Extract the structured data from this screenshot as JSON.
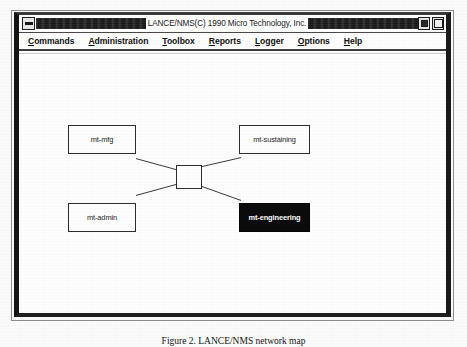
{
  "window": {
    "title": "LANCE/NMS(C) 1990 Micro Technology, Inc.",
    "title_redacted_left": "",
    "title_redacted_right": "",
    "window_menu_icon": "window-menu-icon",
    "minimize_icon": "minimize-icon",
    "maximize_icon": "maximize-icon"
  },
  "menu": {
    "items": [
      {
        "label": "Commands",
        "mnemonic": "C",
        "rest": "ommands"
      },
      {
        "label": "Administration",
        "mnemonic": "A",
        "rest": "dministration"
      },
      {
        "label": "Toolbox",
        "mnemonic": "T",
        "rest": "oolbox"
      },
      {
        "label": "Reports",
        "mnemonic": "R",
        "rest": "eports"
      },
      {
        "label": "Logger",
        "mnemonic": "L",
        "rest": "ogger"
      },
      {
        "label": "Options",
        "mnemonic": "O",
        "rest": "ptions"
      },
      {
        "label": "Help",
        "mnemonic": "H",
        "rest": "elp"
      }
    ]
  },
  "topology": {
    "hub": {
      "name": "hub-node",
      "label": ""
    },
    "nodes": [
      {
        "id": "mt-mfg",
        "label": "mt-mfg",
        "selected": false
      },
      {
        "id": "mt-sustaining",
        "label": "mt-sustaining",
        "selected": false
      },
      {
        "id": "mt-admin",
        "label": "mt-admin",
        "selected": false
      },
      {
        "id": "mt-engineering",
        "label": "mt-engineering",
        "selected": true
      }
    ],
    "colors": {
      "node_border": "#2e2e2e",
      "node_fill": "#ffffff",
      "selected_fill": "#0c0c0c",
      "selected_text": "#ffffff",
      "link_stroke": "#3a3a3a"
    }
  },
  "caption": {
    "text": "Figure 2. LANCE/NMS network map"
  }
}
